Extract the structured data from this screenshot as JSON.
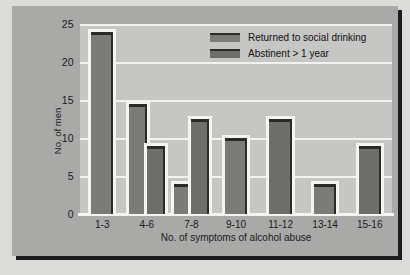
{
  "chart_data": {
    "type": "bar",
    "title": "",
    "xlabel": "No. of symptoms of alcohol abuse",
    "ylabel": "No. of men",
    "ylim": [
      0,
      25
    ],
    "yticks": [
      0,
      5,
      10,
      15,
      20,
      25
    ],
    "grid": true,
    "legend_position": "top-right",
    "categories": [
      "1-3",
      "4-6",
      "7-8",
      "9-10",
      "11-12",
      "13-14",
      "15-16"
    ],
    "series": [
      {
        "name": "Returned to social drinking",
        "color": "#7b7b79",
        "values": [
          24,
          14.5,
          4,
          10,
          null,
          4,
          null
        ]
      },
      {
        "name": "Abstinent > 1 year",
        "color": "#6e6e6c",
        "values": [
          null,
          9,
          12.5,
          null,
          12.5,
          null,
          9
        ]
      }
    ],
    "bars": [
      {
        "category": "1-3",
        "series": "Returned to social drinking",
        "value": 24
      },
      {
        "category": "4-6",
        "series": "Returned to social drinking",
        "value": 14.5
      },
      {
        "category": "4-6",
        "series": "Abstinent > 1 year",
        "value": 9
      },
      {
        "category": "7-8",
        "series": "Returned to social drinking",
        "value": 4
      },
      {
        "category": "7-8",
        "series": "Abstinent > 1 year",
        "value": 12.5
      },
      {
        "category": "9-10",
        "series": "Returned to social drinking",
        "value": 10
      },
      {
        "category": "11-12",
        "series": "Abstinent > 1 year",
        "value": 12.5
      },
      {
        "category": "13-14",
        "series": "Returned to social drinking",
        "value": 4
      },
      {
        "category": "15-16",
        "series": "Abstinent > 1 year",
        "value": 9
      }
    ]
  },
  "legend": {
    "items": [
      {
        "label": "Returned to social drinking",
        "color": "#7b7b79"
      },
      {
        "label": "Abstinent > 1 year",
        "color": "#6e6e6c"
      }
    ]
  },
  "colors": {
    "page_background": "#dcdcda",
    "panel_background": "#a9a9a7",
    "plot_background": "#c6c6c4",
    "gridline": "#f2f2f0",
    "bar_dark": "#6e6e6c",
    "bar_light": "#7b7b79",
    "bar_edge": "#2a2a28",
    "text": "#1b1b1b",
    "shadow": "#1c1c1c"
  }
}
